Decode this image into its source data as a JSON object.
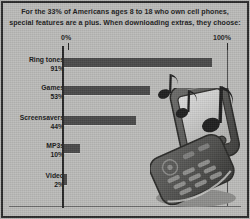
{
  "infographic": {
    "headline": "For the 33% of Americans ages 8 to 18 who own cell phones, special features are a plus. When downloading extras, they choose:",
    "illustration_names": [
      "flip-phone",
      "music-notes"
    ],
    "colors": {
      "background": "#bcbcba",
      "bar": "#4a4a4a",
      "axis": "#262626",
      "text": "#161616",
      "frame": "#2b2b2b"
    }
  },
  "chart_data": {
    "type": "bar",
    "orientation": "horizontal",
    "title": "For the 33% of Americans ages 8 to 18 who own cell phones, special features are a plus. When downloading extras, they choose:",
    "xlabel": "",
    "ylabel": "",
    "xlim": [
      0,
      100
    ],
    "grid": false,
    "legend": null,
    "axis_ticks": [
      {
        "value": 0,
        "label": "0%"
      },
      {
        "value": 100,
        "label": "100%"
      }
    ],
    "categories": [
      "Ring tones",
      "Games",
      "Screensavers",
      "MP3s",
      "Video"
    ],
    "values": [
      91,
      53,
      44,
      10,
      2
    ],
    "value_labels": [
      "91%",
      "53%",
      "44%",
      "10%",
      "2%"
    ],
    "rows": [
      {
        "category": "Ring tones",
        "value": 91,
        "value_label": "91%"
      },
      {
        "category": "Games",
        "value": 53,
        "value_label": "53%"
      },
      {
        "category": "Screensavers",
        "value": 44,
        "value_label": "44%"
      },
      {
        "category": "MP3s",
        "value": 10,
        "value_label": "10%"
      },
      {
        "category": "Video",
        "value": 2,
        "value_label": "2%"
      }
    ]
  }
}
